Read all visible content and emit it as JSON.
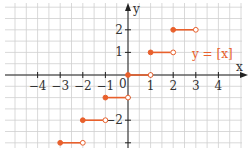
{
  "chart_data": {
    "type": "line",
    "title": "",
    "function_label": "y = [x]",
    "xlabel": "x",
    "ylabel": "y",
    "x_ticks": [
      -4,
      -3,
      -2,
      -1,
      1,
      2,
      3,
      4
    ],
    "y_ticks": [
      -2,
      1,
      2
    ],
    "origin_label": "0",
    "xlim": [
      -5.5,
      5
    ],
    "ylim": [
      -3.3,
      3.3
    ],
    "grid": true,
    "grid_step": 0.5,
    "series": [
      {
        "name": "y = [x]",
        "segments": [
          {
            "x0": -3,
            "x1": -2,
            "y": -3,
            "start_closed": true,
            "end_closed": false
          },
          {
            "x0": -2,
            "x1": -1,
            "y": -2,
            "start_closed": true,
            "end_closed": false
          },
          {
            "x0": -1,
            "x1": 0,
            "y": -1,
            "start_closed": true,
            "end_closed": false
          },
          {
            "x0": 0,
            "x1": 1,
            "y": 0,
            "start_closed": true,
            "end_closed": false
          },
          {
            "x0": 1,
            "x1": 2,
            "y": 1,
            "start_closed": true,
            "end_closed": false
          },
          {
            "x0": 2,
            "x1": 3,
            "y": 2,
            "start_closed": true,
            "end_closed": false
          }
        ]
      }
    ]
  },
  "colors": {
    "series": "#e8602c",
    "grid": "#cfcfcf",
    "axis": "#222222",
    "label": "#333333"
  }
}
